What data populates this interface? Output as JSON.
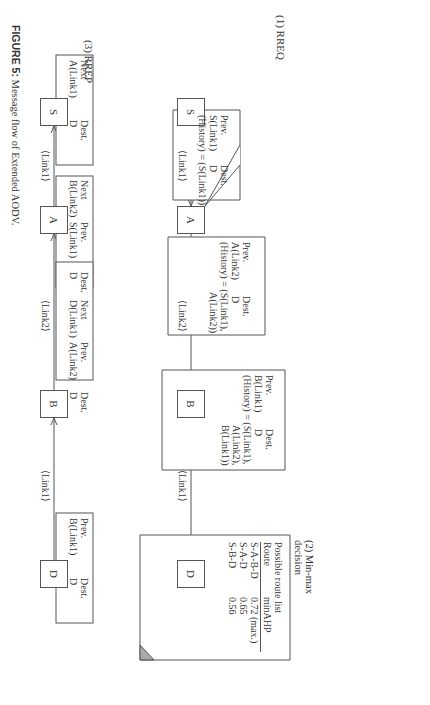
{
  "figure": {
    "caption_label": "FIGURE 5:",
    "caption_text": " Message flow of Extended AODV.",
    "rreq": {
      "title": "(1) RREQ",
      "nodes": [
        "S",
        "A",
        "B",
        "D"
      ],
      "links": [
        "⟨Link1⟩",
        "⟨Link2⟩",
        "⟨Link1⟩"
      ],
      "tables": [
        {
          "node": "A",
          "prev_header": "Prev.",
          "dest_header": "Dest.",
          "prev": "S(Link1)",
          "dest": "D",
          "history": [
            "(History) = (S(Link1))"
          ]
        },
        {
          "node": "B",
          "prev_header": "Prev.",
          "dest_header": "Dest.",
          "prev": "A(Link2)",
          "dest": "D",
          "history": [
            "(History) = (S(Link1),",
            "A(Link2))"
          ]
        },
        {
          "node": "D",
          "prev_header": "Prev.",
          "dest_header": "Dest.",
          "prev": "B(Link1)",
          "dest": "D",
          "history": [
            "(History) = (S(Link1),",
            "A(Link2),",
            "B(Link1))"
          ]
        }
      ]
    },
    "minmax": {
      "title_line1": "(2) Min-max",
      "title_line2": "decision",
      "list_title": "Possible route list",
      "col_route": "Route",
      "col_metric": "minAHP",
      "rows": [
        {
          "route": "S-A-B-D",
          "value": "0.72 (max.)"
        },
        {
          "route": "S-A-D",
          "value": "0.65"
        },
        {
          "route": "S-B-D",
          "value": "0.56"
        }
      ]
    },
    "rrep": {
      "title": "(3) RREP",
      "nodes": [
        "S",
        "A",
        "B",
        "D"
      ],
      "links": [
        "⟨Link1⟩",
        "⟨Link2⟩",
        "⟨Link1⟩"
      ],
      "tables": [
        {
          "node": "S",
          "headers": [
            "Next",
            "Dest."
          ],
          "values": [
            "A(Link1)",
            "D"
          ]
        },
        {
          "node": "A",
          "headers": [
            "Next",
            "Prev.",
            "Dest."
          ],
          "values": [
            "B(Link2)",
            "S(Link1)",
            "D"
          ]
        },
        {
          "node": "B",
          "headers": [
            "Next",
            "Prev.",
            "Dest."
          ],
          "values": [
            "D(Link1)",
            "A(Link2)",
            "D"
          ]
        },
        {
          "node": "D",
          "headers": [
            "Prev.",
            "Dest."
          ],
          "values": [
            "B(Link1)",
            "D"
          ]
        }
      ]
    }
  }
}
